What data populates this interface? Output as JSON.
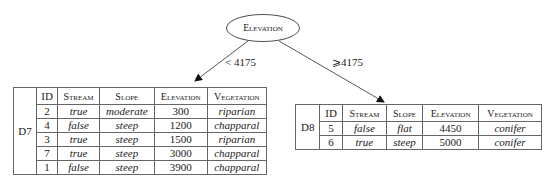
{
  "root": {
    "label": "Elevation"
  },
  "edges": [
    {
      "label": "< 4175",
      "target": "D7"
    },
    {
      "label": "⩾4175",
      "target": "D8"
    }
  ],
  "columns": [
    "ID",
    "Stream",
    "Slope",
    "Elevation",
    "Vegetation"
  ],
  "d7": {
    "name": "D7",
    "rows": [
      {
        "id": "2",
        "stream": "true",
        "slope": "moderate",
        "elevation": "300",
        "vegetation": "riparian"
      },
      {
        "id": "4",
        "stream": "false",
        "slope": "steep",
        "elevation": "1200",
        "vegetation": "chapparal"
      },
      {
        "id": "3",
        "stream": "true",
        "slope": "steep",
        "elevation": "1500",
        "vegetation": "riparian"
      },
      {
        "id": "7",
        "stream": "true",
        "slope": "steep",
        "elevation": "3000",
        "vegetation": "chapparal"
      },
      {
        "id": "1",
        "stream": "false",
        "slope": "steep",
        "elevation": "3900",
        "vegetation": "chapparal"
      }
    ]
  },
  "d8": {
    "name": "D8",
    "rows": [
      {
        "id": "5",
        "stream": "false",
        "slope": "flat",
        "elevation": "4450",
        "vegetation": "conifer"
      },
      {
        "id": "6",
        "stream": "true",
        "slope": "steep",
        "elevation": "5000",
        "vegetation": "conifer"
      }
    ]
  }
}
